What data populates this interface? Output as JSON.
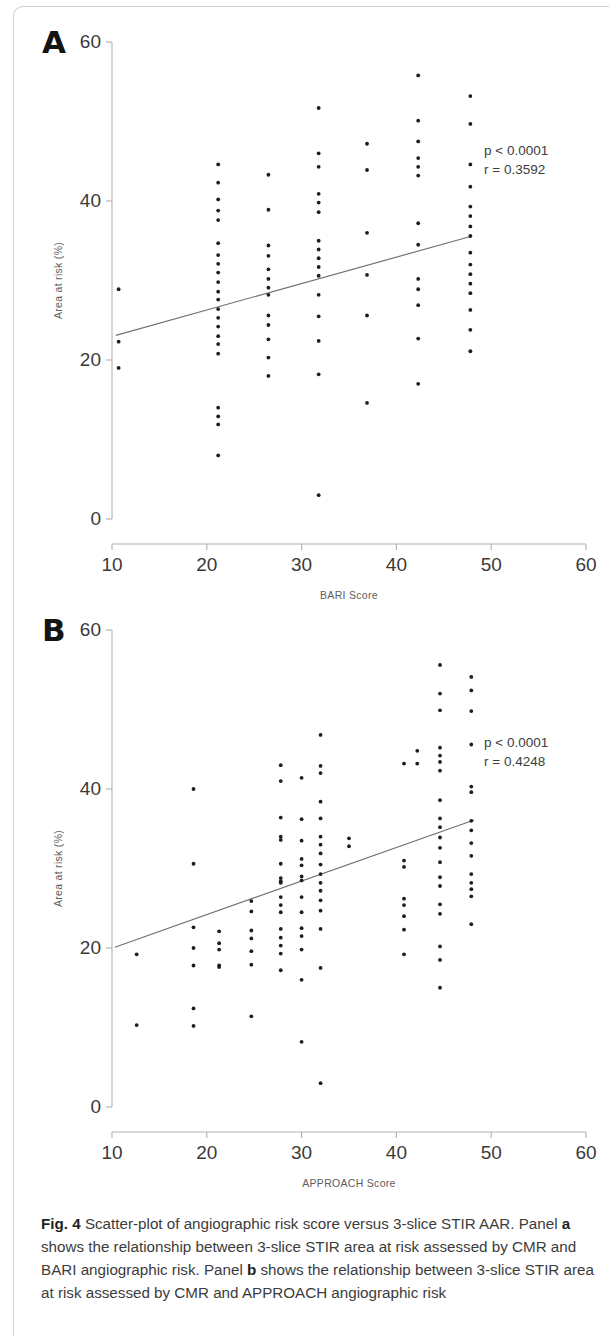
{
  "figure": {
    "caption_label": "Fig. 4",
    "caption_text_1": " Scatter-plot of angiographic risk score versus 3-slice STIR AAR. Panel ",
    "caption_bold_a": "a",
    "caption_text_2": " shows the relationship between 3-slice STIR area at risk assessed by CMR and BARI angiographic risk. Panel ",
    "caption_bold_b": "b",
    "caption_text_3": " shows the relationship between 3-slice STIR area at risk assessed by CMR and APPROACH angiographic risk"
  },
  "panels": {
    "a": {
      "letter": "A"
    },
    "b": {
      "letter": "B"
    }
  },
  "chart_data": [
    {
      "panel": "A",
      "type": "scatter",
      "title": "",
      "xlabel": "BARI Score",
      "ylabel": "Area at risk (%)",
      "xlim": [
        10,
        60
      ],
      "ylim": [
        0,
        60
      ],
      "xticks": [
        10,
        20,
        30,
        40,
        50,
        60
      ],
      "yticks": [
        0,
        20,
        40,
        60
      ],
      "grid": false,
      "legend": "none",
      "annotations": {
        "p_value": "p < 0.0001",
        "r_value": "r  =  0.3592"
      },
      "regression_line": {
        "x": [
          10.4,
          48.0
        ],
        "y": [
          23.1,
          35.6
        ]
      },
      "points": [
        [
          10.7,
          28.9
        ],
        [
          10.7,
          22.3
        ],
        [
          10.7,
          19.0
        ],
        [
          21.2,
          44.6
        ],
        [
          21.2,
          42.3
        ],
        [
          21.2,
          40.2
        ],
        [
          21.2,
          38.8
        ],
        [
          21.2,
          37.6
        ],
        [
          21.2,
          34.7
        ],
        [
          21.2,
          33.2
        ],
        [
          21.2,
          32.1
        ],
        [
          21.2,
          31.0
        ],
        [
          21.2,
          29.8
        ],
        [
          21.2,
          28.6
        ],
        [
          21.2,
          27.6
        ],
        [
          21.2,
          26.4
        ],
        [
          21.2,
          25.3
        ],
        [
          21.2,
          24.2
        ],
        [
          21.2,
          23.0
        ],
        [
          21.2,
          22.0
        ],
        [
          21.2,
          20.8
        ],
        [
          21.2,
          14.0
        ],
        [
          21.2,
          12.9
        ],
        [
          21.2,
          11.9
        ],
        [
          21.2,
          8.0
        ],
        [
          26.5,
          43.3
        ],
        [
          26.5,
          38.9
        ],
        [
          26.5,
          34.4
        ],
        [
          26.5,
          33.1
        ],
        [
          26.5,
          31.4
        ],
        [
          26.5,
          30.2
        ],
        [
          26.5,
          29.1
        ],
        [
          26.5,
          28.2
        ],
        [
          26.5,
          25.6
        ],
        [
          26.5,
          24.4
        ],
        [
          26.5,
          22.6
        ],
        [
          26.5,
          20.3
        ],
        [
          26.5,
          18.0
        ],
        [
          31.8,
          51.7
        ],
        [
          31.8,
          46.0
        ],
        [
          31.8,
          44.3
        ],
        [
          31.8,
          40.9
        ],
        [
          31.8,
          39.8
        ],
        [
          31.8,
          38.6
        ],
        [
          31.8,
          35.0
        ],
        [
          31.8,
          33.9
        ],
        [
          31.8,
          32.8
        ],
        [
          31.8,
          31.7
        ],
        [
          31.8,
          30.6
        ],
        [
          31.8,
          28.2
        ],
        [
          31.8,
          25.5
        ],
        [
          31.8,
          22.4
        ],
        [
          31.8,
          18.2
        ],
        [
          31.8,
          3.0
        ],
        [
          36.9,
          47.2
        ],
        [
          36.9,
          43.9
        ],
        [
          36.9,
          36.0
        ],
        [
          36.9,
          30.7
        ],
        [
          36.9,
          25.6
        ],
        [
          36.9,
          14.6
        ],
        [
          42.3,
          55.8
        ],
        [
          42.3,
          50.1
        ],
        [
          42.3,
          47.5
        ],
        [
          42.3,
          45.4
        ],
        [
          42.3,
          44.3
        ],
        [
          42.3,
          43.2
        ],
        [
          42.3,
          37.2
        ],
        [
          42.3,
          34.5
        ],
        [
          42.3,
          30.2
        ],
        [
          42.3,
          28.9
        ],
        [
          42.3,
          26.9
        ],
        [
          42.3,
          22.7
        ],
        [
          42.3,
          17.0
        ],
        [
          47.8,
          53.2
        ],
        [
          47.8,
          49.7
        ],
        [
          47.8,
          44.6
        ],
        [
          47.8,
          41.8
        ],
        [
          47.8,
          39.3
        ],
        [
          47.8,
          38.1
        ],
        [
          47.8,
          36.8
        ],
        [
          47.8,
          35.6
        ],
        [
          47.8,
          33.5
        ],
        [
          47.8,
          32.0
        ],
        [
          47.8,
          30.8
        ],
        [
          47.8,
          29.6
        ],
        [
          47.8,
          28.4
        ],
        [
          47.8,
          26.3
        ],
        [
          47.8,
          23.8
        ],
        [
          47.8,
          21.1
        ]
      ]
    },
    {
      "panel": "B",
      "type": "scatter",
      "title": "",
      "xlabel": "APPROACH Score",
      "ylabel": "Area at risk (%)",
      "xlim": [
        10,
        60
      ],
      "ylim": [
        0,
        60
      ],
      "xticks": [
        10,
        20,
        30,
        40,
        50,
        60
      ],
      "yticks": [
        0,
        20,
        40,
        60
      ],
      "grid": false,
      "legend": "none",
      "annotations": {
        "p_value": "p < 0.0001",
        "r_value": "r  =  0.4248"
      },
      "regression_line": {
        "x": [
          10.3,
          48.2
        ],
        "y": [
          20.1,
          36.1
        ]
      },
      "points": [
        [
          12.6,
          19.2
        ],
        [
          12.6,
          10.3
        ],
        [
          18.6,
          40.0
        ],
        [
          18.6,
          30.6
        ],
        [
          18.6,
          22.6
        ],
        [
          18.6,
          20.0
        ],
        [
          18.6,
          17.8
        ],
        [
          18.6,
          12.4
        ],
        [
          18.6,
          10.2
        ],
        [
          21.3,
          22.1
        ],
        [
          21.3,
          20.6
        ],
        [
          21.3,
          19.8
        ],
        [
          21.3,
          17.8
        ],
        [
          21.3,
          17.6
        ],
        [
          24.7,
          25.9
        ],
        [
          24.7,
          24.6
        ],
        [
          24.7,
          22.2
        ],
        [
          24.7,
          21.2
        ],
        [
          24.7,
          19.6
        ],
        [
          24.7,
          17.9
        ],
        [
          24.7,
          11.4
        ],
        [
          27.8,
          43.0
        ],
        [
          27.8,
          41.0
        ],
        [
          27.8,
          36.4
        ],
        [
          27.8,
          34.0
        ],
        [
          27.8,
          33.6
        ],
        [
          27.8,
          30.6
        ],
        [
          27.8,
          28.8
        ],
        [
          27.8,
          28.4
        ],
        [
          27.8,
          28.2
        ],
        [
          27.8,
          26.4
        ],
        [
          27.8,
          25.4
        ],
        [
          27.8,
          24.5
        ],
        [
          27.8,
          22.4
        ],
        [
          27.8,
          21.3
        ],
        [
          27.8,
          20.3
        ],
        [
          27.8,
          19.3
        ],
        [
          27.8,
          17.2
        ],
        [
          30.0,
          41.4
        ],
        [
          30.0,
          36.2
        ],
        [
          30.0,
          33.5
        ],
        [
          30.0,
          31.2
        ],
        [
          30.0,
          30.4
        ],
        [
          30.0,
          29.0
        ],
        [
          30.0,
          28.5
        ],
        [
          30.0,
          26.4
        ],
        [
          30.0,
          24.5
        ],
        [
          30.0,
          22.5
        ],
        [
          30.0,
          21.5
        ],
        [
          30.0,
          19.8
        ],
        [
          30.0,
          16.0
        ],
        [
          30.0,
          8.2
        ],
        [
          32.0,
          46.8
        ],
        [
          32.0,
          42.9
        ],
        [
          32.0,
          42.0
        ],
        [
          32.0,
          38.4
        ],
        [
          32.0,
          36.3
        ],
        [
          32.0,
          34.0
        ],
        [
          32.0,
          33.0
        ],
        [
          32.0,
          31.9
        ],
        [
          32.0,
          30.5
        ],
        [
          32.0,
          29.3
        ],
        [
          32.0,
          28.2
        ],
        [
          32.0,
          27.2
        ],
        [
          32.0,
          26.0
        ],
        [
          32.0,
          24.7
        ],
        [
          32.0,
          22.4
        ],
        [
          32.0,
          17.5
        ],
        [
          32.0,
          3.0
        ],
        [
          35.0,
          33.8
        ],
        [
          35.0,
          32.8
        ],
        [
          40.8,
          43.2
        ],
        [
          40.8,
          31.0
        ],
        [
          40.8,
          30.2
        ],
        [
          40.8,
          26.2
        ],
        [
          40.8,
          25.4
        ],
        [
          40.8,
          24.0
        ],
        [
          40.8,
          22.3
        ],
        [
          40.8,
          19.2
        ],
        [
          42.2,
          43.2
        ],
        [
          42.2,
          44.8
        ],
        [
          44.6,
          55.6
        ],
        [
          44.6,
          52.0
        ],
        [
          44.6,
          49.9
        ],
        [
          44.6,
          45.2
        ],
        [
          44.6,
          44.2
        ],
        [
          44.6,
          43.4
        ],
        [
          44.6,
          42.3
        ],
        [
          44.6,
          38.6
        ],
        [
          44.6,
          36.3
        ],
        [
          44.6,
          35.2
        ],
        [
          44.6,
          33.9
        ],
        [
          44.6,
          32.6
        ],
        [
          44.6,
          30.8
        ],
        [
          44.6,
          28.9
        ],
        [
          44.6,
          27.8
        ],
        [
          44.6,
          25.5
        ],
        [
          44.6,
          24.3
        ],
        [
          44.6,
          20.2
        ],
        [
          44.6,
          18.5
        ],
        [
          44.6,
          15.0
        ],
        [
          47.9,
          54.1
        ],
        [
          47.9,
          52.4
        ],
        [
          47.9,
          49.8
        ],
        [
          47.9,
          45.6
        ],
        [
          47.9,
          40.3
        ],
        [
          47.9,
          39.6
        ],
        [
          47.9,
          36.0
        ],
        [
          47.9,
          34.8
        ],
        [
          47.9,
          33.2
        ],
        [
          47.9,
          31.6
        ],
        [
          47.9,
          29.3
        ],
        [
          47.9,
          28.2
        ],
        [
          47.9,
          27.4
        ],
        [
          47.9,
          26.5
        ],
        [
          47.9,
          23.0
        ]
      ]
    }
  ]
}
